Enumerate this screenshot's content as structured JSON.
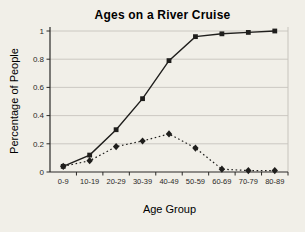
{
  "chart_data": {
    "type": "line",
    "title": "Ages on a River Cruise",
    "xlabel": "Age Group",
    "ylabel": "Percentage of People",
    "categories": [
      "0-9",
      "10-19",
      "20-29",
      "30-39",
      "40-49",
      "50-59",
      "60-69",
      "70-79",
      "80-89"
    ],
    "series": [
      {
        "name": "solid-line-squares",
        "marker": "square",
        "line_style": "solid",
        "values": [
          0.04,
          0.12,
          0.3,
          0.52,
          0.79,
          0.96,
          0.98,
          0.99,
          1.0
        ]
      },
      {
        "name": "dotted-line-diamonds",
        "marker": "diamond",
        "line_style": "dotted",
        "values": [
          0.04,
          0.08,
          0.18,
          0.22,
          0.27,
          0.17,
          0.02,
          0.01,
          0.01
        ]
      }
    ],
    "ylim": [
      0,
      1
    ],
    "yticks": [
      0,
      0.2,
      0.4,
      0.6,
      0.8,
      1
    ],
    "ytick_labels": [
      "0",
      "0.2",
      "0.4",
      "0.6",
      "0.8",
      "1"
    ],
    "grid": "horizontal",
    "legend": "none",
    "colors": {
      "line": "#1f1e1c",
      "grid": "#c7c4bd",
      "axis": "#2a2927",
      "text": "#2a2927",
      "background": "#f1efe8"
    }
  }
}
